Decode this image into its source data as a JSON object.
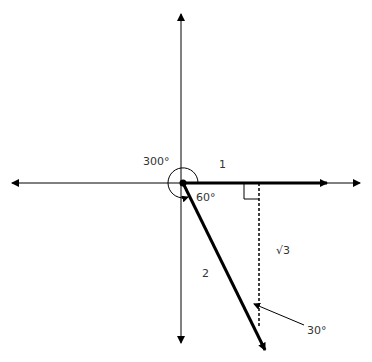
{
  "diagram": {
    "type": "unit-circle angle diagram",
    "labels": {
      "angle_major": "300°",
      "angle_reference": "60°",
      "side_horizontal": "1",
      "side_hypotenuse": "2",
      "side_vertical": "√3",
      "angle_annotation": "30°"
    },
    "colors": {
      "line": "#000000",
      "axis": "#000000",
      "text": "#333333",
      "background": "#ffffff"
    }
  }
}
